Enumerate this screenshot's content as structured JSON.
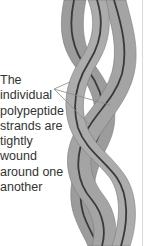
{
  "figure": {
    "colors": {
      "strand_fill": "#9c9c9c",
      "strand_edge": "#7a7a7a",
      "backbone_line": "#3a3a3a",
      "label_text": "#333333",
      "pointer_line": "#8a8a8a"
    }
  },
  "annotation": {
    "lines": [
      "The",
      "individual",
      "polypeptide",
      "strands are",
      "tightly",
      "wound",
      "around one",
      "another"
    ]
  }
}
